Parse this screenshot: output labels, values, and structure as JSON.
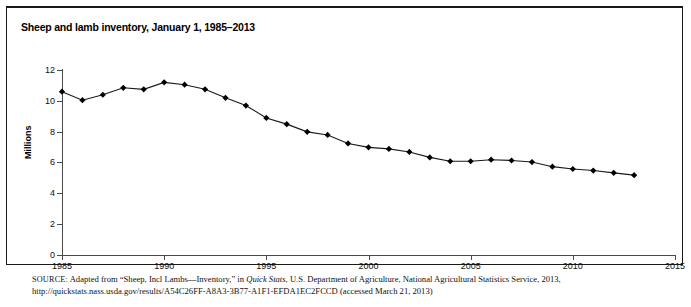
{
  "figure": {
    "title": "Sheep and lamb inventory, January 1, 1985–2013",
    "y_axis_title": "Millions"
  },
  "source_note": {
    "label": "SOURCE:",
    "line1_part1": " Adapted from “Sheep, Incl Lambs—Inventory,” in ",
    "line1_italic": "Quick Stats",
    "line1_part2": ", U.S. Department of Agriculture, National Agricultural Statistics Service, 2013,",
    "line2_url": "http://quickstats.nass.usda.gov/results/A54C26FF-A8A3-3B77-A1F1-EFDA1EC2FCCD",
    "line2_tail": " (accessed March 21, 2013)"
  },
  "chart_data": {
    "type": "line",
    "title": "Sheep and lamb inventory, January 1, 1985–2013",
    "xlabel": "",
    "ylabel": "Millions",
    "xlim": [
      1985,
      2015
    ],
    "ylim": [
      0,
      12
    ],
    "ytick_values": [
      0,
      2,
      4,
      6,
      8,
      10,
      12
    ],
    "ytick_labels": [
      "0",
      "2",
      "4",
      "6",
      "8",
      "10",
      "12"
    ],
    "xtick_values": [
      1985,
      1990,
      1995,
      2000,
      2005,
      2010,
      2015
    ],
    "xtick_labels": [
      "1985",
      "1990",
      "1995",
      "2000",
      "2005",
      "2010",
      "2015"
    ],
    "grid": false,
    "legend": false,
    "marker": "diamond",
    "line_color": "#1a1a1a",
    "marker_color": "#000000",
    "x": [
      1985,
      1986,
      1987,
      1988,
      1989,
      1990,
      1991,
      1992,
      1993,
      1994,
      1995,
      1996,
      1997,
      1998,
      1999,
      2000,
      2001,
      2002,
      2003,
      2004,
      2005,
      2006,
      2007,
      2008,
      2009,
      2010,
      2011,
      2012,
      2013
    ],
    "values": [
      10.6,
      10.05,
      10.4,
      10.85,
      10.75,
      11.2,
      11.05,
      10.75,
      10.2,
      9.7,
      8.9,
      8.5,
      8.0,
      7.8,
      7.25,
      7.0,
      6.9,
      6.7,
      6.35,
      6.1,
      6.1,
      6.2,
      6.15,
      6.05,
      5.75,
      5.6,
      5.5,
      5.35,
      5.2
    ],
    "series": [
      {
        "name": "Sheep and lambs inventory (millions)",
        "values": [
          10.6,
          10.05,
          10.4,
          10.85,
          10.75,
          11.2,
          11.05,
          10.75,
          10.2,
          9.7,
          8.9,
          8.5,
          8.0,
          7.8,
          7.25,
          7.0,
          6.9,
          6.7,
          6.35,
          6.1,
          6.1,
          6.2,
          6.15,
          6.05,
          5.75,
          5.6,
          5.5,
          5.35,
          5.2
        ]
      }
    ]
  }
}
